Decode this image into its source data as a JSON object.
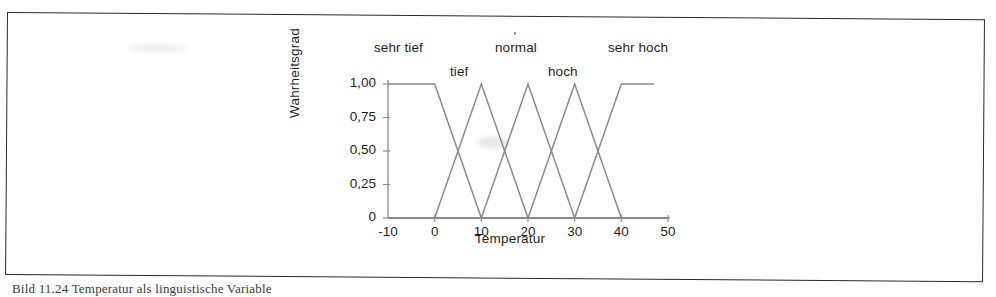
{
  "figure": {
    "category_labels": [
      {
        "text": "sehr tief",
        "x": 84,
        "y": 18
      },
      {
        "text": "tief",
        "x": 160,
        "y": 42
      },
      {
        "text": "normal",
        "x": 205,
        "y": 18
      },
      {
        "text": "hoch",
        "x": 258,
        "y": 42
      },
      {
        "text": "sehr hoch",
        "x": 318,
        "y": 18
      }
    ],
    "caption": "Bild 11.24 Temperatur als linguistische Variable"
  },
  "chart_data": {
    "type": "line",
    "title": "",
    "xlabel": "Temperatur",
    "ylabel": "Wahrheitsgrad",
    "xlim": [
      -10,
      50
    ],
    "ylim": [
      0,
      1
    ],
    "xticks": [
      -10,
      0,
      10,
      20,
      30,
      40,
      50
    ],
    "xtick_labels": [
      "-10",
      "0",
      "10",
      "20",
      "30",
      "40",
      "50"
    ],
    "yticks": [
      0,
      0.25,
      0.5,
      0.75,
      1
    ],
    "ytick_labels": [
      "0",
      "0,25",
      "0,50",
      "0,75",
      "1,00"
    ],
    "grid": false,
    "legend": "none",
    "line_color": "#8a8a8a",
    "axis_color": "#8a8a8a",
    "series": [
      {
        "name": "sehr tief",
        "points": [
          [
            -10,
            1
          ],
          [
            0,
            1
          ],
          [
            10,
            0
          ],
          [
            50,
            0
          ]
        ]
      },
      {
        "name": "tief",
        "points": [
          [
            -10,
            0
          ],
          [
            0,
            0
          ],
          [
            10,
            1
          ],
          [
            20,
            0
          ],
          [
            50,
            0
          ]
        ]
      },
      {
        "name": "normal",
        "points": [
          [
            -10,
            0
          ],
          [
            10,
            0
          ],
          [
            20,
            1
          ],
          [
            30,
            0
          ],
          [
            50,
            0
          ]
        ]
      },
      {
        "name": "hoch",
        "points": [
          [
            -10,
            0
          ],
          [
            20,
            0
          ],
          [
            30,
            1
          ],
          [
            40,
            0
          ],
          [
            50,
            0
          ]
        ]
      },
      {
        "name": "sehr hoch",
        "points": [
          [
            -10,
            0
          ],
          [
            30,
            0
          ],
          [
            40,
            1
          ],
          [
            47,
            1
          ]
        ]
      }
    ]
  }
}
